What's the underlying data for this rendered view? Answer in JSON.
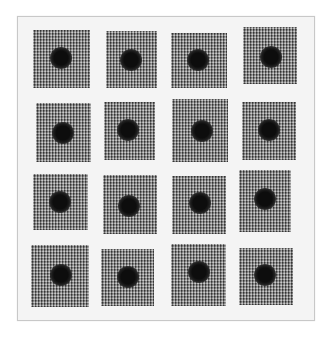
{
  "image": {
    "description": "Grid of 16 hand-drawn textured gray squares, each with a dark dot near its center, on a light paper background within a thin frame",
    "frame": {
      "x": 17,
      "y": 16,
      "w": 296,
      "h": 303,
      "background": "#f4f4f4",
      "border": "#c8c8c8"
    },
    "grid": {
      "rows": 4,
      "cols": 4
    },
    "colors": {
      "square": "#7a7a7a",
      "dot": "#0d0d0d",
      "page": "#ffffff"
    },
    "squares": [
      {
        "x": 33,
        "y": 30,
        "w": 57,
        "h": 58,
        "dx": 61,
        "dy": 58,
        "r": 8
      },
      {
        "x": 106,
        "y": 31,
        "w": 51,
        "h": 57,
        "dx": 131,
        "dy": 60,
        "r": 8
      },
      {
        "x": 171,
        "y": 33,
        "w": 56,
        "h": 55,
        "dx": 198,
        "dy": 60,
        "r": 8
      },
      {
        "x": 243,
        "y": 27,
        "w": 54,
        "h": 57,
        "dx": 271,
        "dy": 57,
        "r": 8
      },
      {
        "x": 36,
        "y": 103,
        "w": 55,
        "h": 59,
        "dx": 63,
        "dy": 133,
        "r": 8
      },
      {
        "x": 104,
        "y": 102,
        "w": 51,
        "h": 58,
        "dx": 128,
        "dy": 130,
        "r": 8
      },
      {
        "x": 172,
        "y": 99,
        "w": 56,
        "h": 63,
        "dx": 202,
        "dy": 131,
        "r": 8
      },
      {
        "x": 242,
        "y": 102,
        "w": 54,
        "h": 58,
        "dx": 269,
        "dy": 130,
        "r": 8
      },
      {
        "x": 33,
        "y": 174,
        "w": 55,
        "h": 56,
        "dx": 60,
        "dy": 202,
        "r": 8
      },
      {
        "x": 103,
        "y": 175,
        "w": 54,
        "h": 59,
        "dx": 129,
        "dy": 206,
        "r": 8
      },
      {
        "x": 172,
        "y": 176,
        "w": 54,
        "h": 58,
        "dx": 200,
        "dy": 203,
        "r": 8
      },
      {
        "x": 239,
        "y": 170,
        "w": 52,
        "h": 62,
        "dx": 265,
        "dy": 199,
        "r": 8
      },
      {
        "x": 31,
        "y": 245,
        "w": 58,
        "h": 62,
        "dx": 61,
        "dy": 275,
        "r": 8
      },
      {
        "x": 101,
        "y": 249,
        "w": 53,
        "h": 57,
        "dx": 128,
        "dy": 277,
        "r": 8
      },
      {
        "x": 171,
        "y": 244,
        "w": 55,
        "h": 62,
        "dx": 199,
        "dy": 272,
        "r": 8
      },
      {
        "x": 239,
        "y": 248,
        "w": 54,
        "h": 57,
        "dx": 265,
        "dy": 275,
        "r": 8
      }
    ]
  }
}
